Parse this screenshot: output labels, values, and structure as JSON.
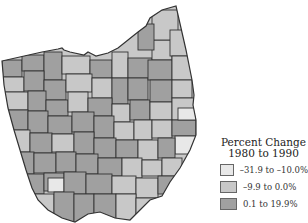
{
  "map": {
    "region": "Ohio counties",
    "colors": {
      "low": "#e8e8e8",
      "mid": "#c8c8c8",
      "high": "#a0a0a0",
      "border": "#333333"
    }
  },
  "legend": {
    "title_line1": "Percent Change",
    "title_line2": "1980 to 1990",
    "items": [
      {
        "label": "–31.9 to –10.0%",
        "color": "#e8e8e8"
      },
      {
        "label": "–9.9 to 0.0%",
        "color": "#c8c8c8"
      },
      {
        "label": "0.1 to 19.9%",
        "color": "#a0a0a0"
      }
    ]
  }
}
